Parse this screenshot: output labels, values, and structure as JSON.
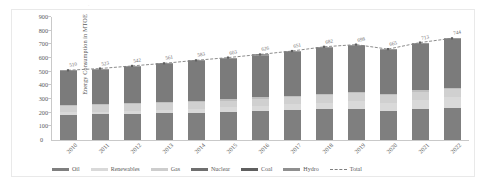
{
  "chart_data": {
    "type": "bar",
    "stacked": true,
    "title": "",
    "subtitle": "",
    "xlabel": "",
    "ylabel": "Energy Consumption in MTOE",
    "ylim": [
      0,
      900
    ],
    "ytick_step": 100,
    "yticks": [
      "900",
      "800",
      "700",
      "600",
      "500",
      "400",
      "300",
      "200",
      "100",
      "0"
    ],
    "grid": false,
    "legend_position": "bottom",
    "categories": [
      "2010",
      "2011",
      "2012",
      "2013",
      "2014",
      "2015",
      "2016",
      "2017",
      "2018",
      "2019",
      "2020",
      "2021",
      "2022"
    ],
    "series": [
      {
        "name": "Oil",
        "color": "#7f7f7f",
        "values": [
          185,
          188,
          192,
          196,
          200,
          206,
          212,
          218,
          224,
          228,
          214,
          226,
          236
        ]
      },
      {
        "name": "Renewables",
        "color": "#d9d9d9",
        "values": [
          18,
          20,
          23,
          26,
          30,
          34,
          39,
          44,
          50,
          56,
          60,
          68,
          76
        ]
      },
      {
        "name": "Gas",
        "color": "#d0d0d0",
        "values": [
          46,
          47,
          48,
          47,
          48,
          49,
          51,
          53,
          55,
          57,
          55,
          58,
          60
        ]
      },
      {
        "name": "Nuclear",
        "color": "#bfbfbf",
        "values": [
          8,
          8,
          9,
          9,
          9,
          10,
          10,
          10,
          11,
          11,
          10,
          11,
          12
        ]
      },
      {
        "name": "Coal",
        "color": "#7b7b7b",
        "values": [
          245,
          252,
          262,
          275,
          288,
          296,
          306,
          318,
          334,
          338,
          318,
          342,
          352
        ]
      },
      {
        "name": "Hydro",
        "color": "#9a9a9a",
        "values": [
          8,
          8,
          8,
          8,
          8,
          8,
          8,
          8,
          8,
          8,
          8,
          8,
          8
        ]
      }
    ],
    "total_line": {
      "name": "Total",
      "style": "dashed",
      "color": "#7f7f7f",
      "values": [
        510,
        523,
        542,
        561,
        583,
        603,
        626,
        651,
        682,
        698,
        665,
        713,
        744
      ],
      "labels": [
        "510",
        "523",
        "542",
        "561",
        "583",
        "603",
        "626",
        "651",
        "682",
        "698",
        "665",
        "713",
        "744"
      ]
    }
  },
  "legend": {
    "items": [
      {
        "label": "Oil",
        "swatch": "solid",
        "color": "#7f7f7f"
      },
      {
        "label": "Renewables",
        "swatch": "solid",
        "color": "#d9d9d9"
      },
      {
        "label": "Gas",
        "swatch": "solid",
        "color": "#cdcdcd"
      },
      {
        "label": "Nuclear",
        "swatch": "solid",
        "color": "#6f6f6f"
      },
      {
        "label": "Coal",
        "swatch": "solid",
        "color": "#5f5f5f"
      },
      {
        "label": "Hydro",
        "swatch": "solid",
        "color": "#8f8f8f"
      },
      {
        "label": "Total",
        "swatch": "dashed",
        "color": "#7f7f7f"
      }
    ]
  },
  "axis": {
    "y_title": "Energy Consumption in MTOE",
    "zero_label": "0"
  }
}
